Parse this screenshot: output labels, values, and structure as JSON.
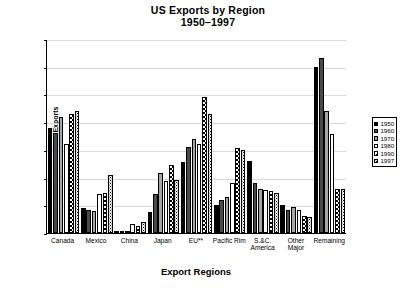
{
  "chart_data": {
    "type": "bar",
    "title": "US Exports by Region",
    "subtitle": "1950–1997",
    "xlabel": "Export Regions",
    "ylabel": "% of Total Exports",
    "ylim": [
      0,
      35
    ],
    "ytick_labels": [
      "0.0",
      "5.0",
      "10.0",
      "15.0",
      "20.0",
      "25.0",
      "30.0",
      "35.0"
    ],
    "ytick_values": [
      0,
      5,
      10,
      15,
      20,
      25,
      30,
      35
    ],
    "grid": true,
    "legend_position": "right",
    "categories": [
      "Canada",
      "Mexico",
      "China",
      "Japan",
      "EU**",
      "Pacific Rim",
      "S.&C. America",
      "Other Major",
      "Remaining"
    ],
    "series": [
      {
        "name": "1950",
        "values": [
          19.0,
          4.5,
          0.2,
          3.8,
          12.8,
          5.0,
          13.0,
          5.0,
          30.0
        ]
      },
      {
        "name": "1960",
        "values": [
          18.0,
          4.2,
          0.1,
          7.0,
          15.5,
          6.0,
          9.0,
          4.2,
          31.5
        ]
      },
      {
        "name": "1970",
        "values": [
          21.0,
          4.0,
          0.1,
          10.8,
          17.0,
          6.5,
          8.0,
          4.7,
          22.0
        ]
      },
      {
        "name": "1980",
        "values": [
          16.0,
          7.0,
          1.6,
          9.4,
          16.0,
          9.0,
          7.7,
          4.2,
          17.8
        ]
      },
      {
        "name": "1990",
        "values": [
          21.5,
          7.2,
          1.2,
          12.3,
          24.5,
          15.3,
          7.5,
          3.0,
          8.0
        ]
      },
      {
        "name": "1997",
        "values": [
          22.0,
          10.5,
          1.9,
          9.6,
          21.5,
          15.0,
          7.2,
          2.8,
          7.9
        ]
      }
    ]
  },
  "legend": {
    "items": [
      {
        "label": "1950"
      },
      {
        "label": "1960"
      },
      {
        "label": "1970"
      },
      {
        "label": "1980"
      },
      {
        "label": "1990"
      },
      {
        "label": "1997"
      }
    ]
  }
}
